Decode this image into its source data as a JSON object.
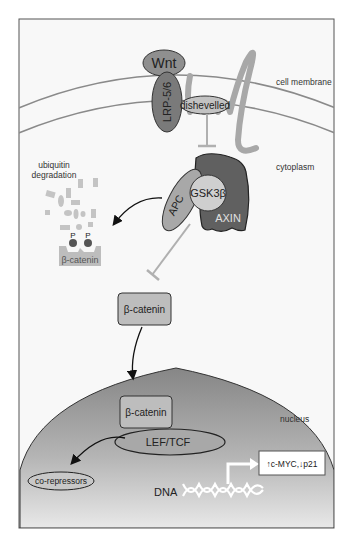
{
  "diagram": {
    "compartments": {
      "membrane": "cell membrane",
      "cytoplasm": "cytoplasm",
      "nucleus": "nucleus"
    },
    "proteins": {
      "wnt": "Wnt",
      "lrp": "LRP-5/6",
      "dishevelled": "dishevelled",
      "apc": "APC",
      "gsk": "GSK3β",
      "axin": "AXIN",
      "bcat_degraded": "β-catenin",
      "bcat_cytoplasm": "β-catenin",
      "bcat_nucleus": "β-catenin",
      "lef": "LEF/TCF",
      "corepressors": "co-repressors"
    },
    "labels": {
      "ubiquitin_line1": "ubiquitin",
      "ubiquitin_line2": "degradation",
      "phospho1": "P",
      "phospho2": "P",
      "dna": "DNA",
      "target_genes": "↑c-MYC,↓p21"
    },
    "colors": {
      "frame": "#555555",
      "background": "#f7f7f7",
      "membrane_line": "#8a8a8a",
      "receptor_gray": "#9a9a9a",
      "frizzled": "#a8a8a8",
      "wnt_fill": "#8f8f8f",
      "lrp_fill": "#7a7a7a",
      "dishevelled_fill": "#c2c2c2",
      "axin_fill": "#606060",
      "apc_fill": "#a8a8a8",
      "gsk_fill": "#cfcfcf",
      "bcat_fill": "#bdbdbd",
      "inhibit_line": "#b0b0b0",
      "nucleus_top": "#8c8c8c",
      "nucleus_bottom": "#e6e6e6",
      "fragment": "#c4c4c4",
      "phospho_dot": "#555555"
    }
  }
}
